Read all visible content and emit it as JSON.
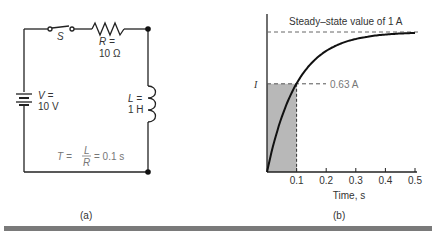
{
  "circuit": {
    "switch_label": "S",
    "resistor_label_1": "R =",
    "resistor_label_2": "10 Ω",
    "source_label_1": "V =",
    "source_label_2": "10 V",
    "inductor_label_1": "L =",
    "inductor_label_2": "1 H",
    "time_constant_T": "T =",
    "time_constant_num": "L",
    "time_constant_den": "R",
    "time_constant_value": "= 0.1 s",
    "caption": "(a)"
  },
  "graph": {
    "caption": "(b)"
  },
  "chart_data": {
    "type": "line",
    "title": "",
    "xlabel": "Time, s",
    "ylabel": "I",
    "x_ticks": [
      "0.1",
      "0.2",
      "0.3",
      "0.4",
      "0.5"
    ],
    "xlim": [
      0,
      0.5
    ],
    "ylim": [
      0,
      1
    ],
    "series": [
      {
        "name": "current rise",
        "function": "1 - exp(-t/0.1)",
        "x": [
          0,
          0.05,
          0.1,
          0.15,
          0.2,
          0.3,
          0.4,
          0.5
        ],
        "values": [
          0,
          0.39,
          0.63,
          0.78,
          0.86,
          0.95,
          0.98,
          0.99
        ]
      }
    ],
    "annotations": [
      {
        "text": "Steady–state value of 1 A",
        "y": 1.0
      },
      {
        "text": "0.63 A",
        "x": 0.1,
        "y": 0.63
      }
    ],
    "shaded_region": {
      "x": [
        0,
        0.1
      ],
      "y": [
        0,
        0.63
      ]
    },
    "grid": false
  }
}
